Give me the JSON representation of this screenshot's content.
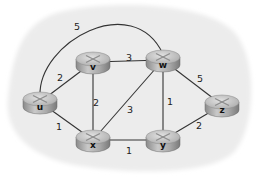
{
  "diagram": {
    "type": "network-graph",
    "background_color": "#ececec",
    "node_color": "#b8b8b8",
    "edge_color": "#333333",
    "nodes": [
      {
        "id": "u",
        "label": "u",
        "x": 40,
        "y": 102
      },
      {
        "id": "v",
        "label": "v",
        "x": 93,
        "y": 62
      },
      {
        "id": "w",
        "label": "w",
        "x": 163,
        "y": 60
      },
      {
        "id": "z",
        "label": "z",
        "x": 222,
        "y": 105
      },
      {
        "id": "x",
        "label": "x",
        "x": 93,
        "y": 140
      },
      {
        "id": "y",
        "label": "y",
        "x": 163,
        "y": 140
      }
    ],
    "edges": [
      {
        "from": "u",
        "to": "w",
        "cost": "5",
        "curved": true,
        "label_x": 77,
        "label_y": 30
      },
      {
        "from": "u",
        "to": "v",
        "cost": "2",
        "label_x": 60,
        "label_y": 81
      },
      {
        "from": "v",
        "to": "w",
        "cost": "3",
        "label_x": 129,
        "label_y": 61
      },
      {
        "from": "v",
        "to": "x",
        "cost": "2",
        "label_x": 96,
        "label_y": 106
      },
      {
        "from": "w",
        "to": "x",
        "cost": "3",
        "label_x": 130,
        "label_y": 113
      },
      {
        "from": "w",
        "to": "y",
        "cost": "1",
        "label_x": 170,
        "label_y": 105
      },
      {
        "from": "w",
        "to": "z",
        "cost": "5",
        "label_x": 200,
        "label_y": 82
      },
      {
        "from": "u",
        "to": "x",
        "cost": "1",
        "label_x": 59,
        "label_y": 130
      },
      {
        "from": "x",
        "to": "y",
        "cost": "1",
        "label_x": 129,
        "label_y": 154
      },
      {
        "from": "y",
        "to": "z",
        "cost": "2",
        "label_x": 199,
        "label_y": 129
      }
    ]
  }
}
